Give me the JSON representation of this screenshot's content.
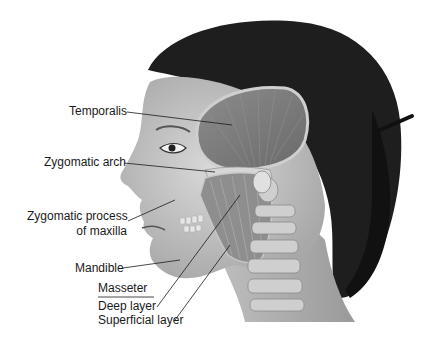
{
  "figure": {
    "labels": {
      "temporalis": "Temporalis",
      "zygomatic_arch": "Zygomatic arch",
      "zygomatic_process_line1": "Zygomatic process",
      "zygomatic_process_line2": "of maxilla",
      "mandible": "Mandible",
      "masseter": "Masseter",
      "deep_layer": "Deep layer",
      "superficial_layer": "Superficial layer"
    }
  }
}
